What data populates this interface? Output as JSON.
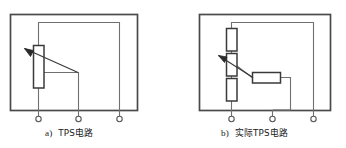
{
  "figure": {
    "background_color": "#ffffff",
    "line_color": "#3a3a3a",
    "wire_color": "#555555",
    "text_color": "#1a1a1a",
    "panels": [
      {
        "id": "panel-a",
        "caption_label": "a)",
        "caption_text": "TPS电路",
        "box": {
          "x": 10,
          "y": 14,
          "width": 127,
          "height": 96
        },
        "components": [
          {
            "name": "potentiometer",
            "type": "variable-resistor",
            "x": 33,
            "y": 45,
            "width": 11,
            "height": 43,
            "orientation": "vertical"
          }
        ],
        "terminals": [
          {
            "name": "terminal-1",
            "cx": 38,
            "cy": 119,
            "r": 2.6
          },
          {
            "name": "terminal-2",
            "cx": 78,
            "cy": 119,
            "r": 2.6
          },
          {
            "name": "terminal-3",
            "cx": 118,
            "cy": 119,
            "r": 2.6
          }
        ]
      },
      {
        "id": "panel-b",
        "caption_label": "b)",
        "caption_text": "实际TPS电路",
        "box": {
          "x": 199,
          "y": 14,
          "width": 131,
          "height": 96
        },
        "components": [
          {
            "name": "resistor-top",
            "type": "resistor",
            "x": 226,
            "y": 28,
            "width": 11,
            "height": 23,
            "orientation": "vertical"
          },
          {
            "name": "potentiometer",
            "type": "variable-resistor",
            "x": 226,
            "y": 53,
            "width": 11,
            "height": 23,
            "orientation": "vertical"
          },
          {
            "name": "resistor-bottom",
            "type": "resistor",
            "x": 226,
            "y": 78,
            "width": 11,
            "height": 23,
            "orientation": "vertical"
          },
          {
            "name": "resistor-series",
            "type": "resistor",
            "x": 252,
            "y": 72,
            "width": 28,
            "height": 11,
            "orientation": "horizontal"
          }
        ],
        "terminals": [
          {
            "name": "terminal-1",
            "cx": 231,
            "cy": 119,
            "r": 2.6
          },
          {
            "name": "terminal-2",
            "cx": 272,
            "cy": 119,
            "r": 2.6
          },
          {
            "name": "terminal-3",
            "cx": 312,
            "cy": 119,
            "r": 2.6
          }
        ]
      }
    ]
  }
}
